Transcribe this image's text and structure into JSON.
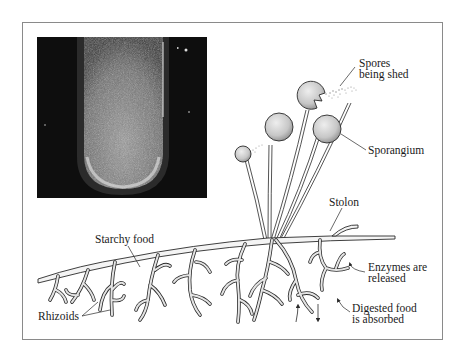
{
  "figure": {
    "photo": {
      "description": "Photograph of mold growing in a test tube",
      "colors": {
        "background": "#0d0d0d",
        "growth": "#c8c8c8"
      }
    },
    "labels": {
      "spores": [
        "Spores",
        "being shed"
      ],
      "sporangium": "Sporangium",
      "stolon": "Stolon",
      "starchy_food": "Starchy food",
      "enzymes": [
        "Enzymes are",
        "released"
      ],
      "digested": [
        "Digested food",
        "is absorbed"
      ],
      "rhizoids": "Rhizoids"
    },
    "colors": {
      "frame": "#8a8a8a",
      "line": "#2a2a2a",
      "hypha_fill": "#e4e4e4",
      "sporangium_fill": "#cfcfcf"
    }
  }
}
